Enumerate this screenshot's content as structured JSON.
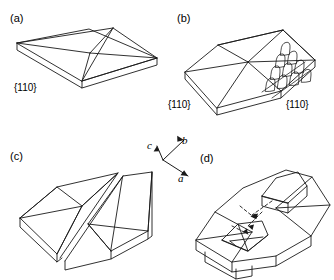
{
  "figure": {
    "kind": "crystal-morphology-line-diagram",
    "background_color": "#ffffff",
    "stroke_color": "#1a1a1a",
    "width": 334,
    "height": 280,
    "panels": [
      {
        "id": "a",
        "label": "(a)",
        "description": "Low four-sided pyramid on a thin tabular base plate",
        "face_indices": [
          "{110}"
        ]
      },
      {
        "id": "b",
        "label": "(b)",
        "description": "Six-sided pyramid on a thin tabular base with rows of rounded hopper etch pits on the right front facet",
        "face_indices": [
          "{110}",
          "{110}"
        ],
        "etch_pits": {
          "shape": "arched-dome",
          "columns": 4,
          "rows": 4
        }
      },
      {
        "id": "c",
        "label": "(c)",
        "description": "Two offset roof-ridge crystals in twinned contact along a common plane",
        "face_indices": []
      },
      {
        "id": "d",
        "label": "(d)",
        "description": "Platy crystal with two re-entrant notches and dashed arrows indicating inward growth directions",
        "face_indices": [],
        "arrows": {
          "style": "dashed",
          "count": 4,
          "direction": "inward-to-centre"
        }
      }
    ],
    "axis_triad": {
      "origin": {
        "x": 163,
        "y": 160
      },
      "axes": [
        {
          "name": "a",
          "label": "a",
          "direction": "down-right"
        },
        {
          "name": "b",
          "label": "b",
          "direction": "up-right"
        },
        {
          "name": "c",
          "label": "c",
          "direction": "up-left"
        }
      ]
    }
  }
}
